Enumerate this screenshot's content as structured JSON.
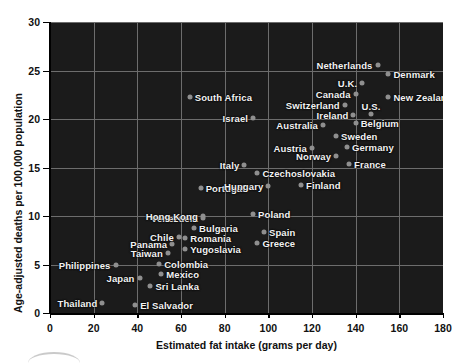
{
  "chart_data": {
    "type": "scatter",
    "title": "",
    "xlabel": "Estimated fat intake (grams per day)",
    "ylabel": "Age-adjusted deaths per 100,000 population",
    "xlim": [
      0,
      180
    ],
    "ylim": [
      0,
      30
    ],
    "xticks": [
      0,
      20,
      40,
      60,
      80,
      100,
      120,
      140,
      160,
      180
    ],
    "yticks": [
      0,
      5,
      10,
      15,
      20,
      25,
      30
    ],
    "grid": true,
    "legend": "none",
    "background": "#1b1b1b",
    "point_color": "#8f8f8f",
    "label_color": "#f2f2f2",
    "points": [
      {
        "name": "Thailand",
        "x": 24,
        "y": 1.0,
        "side": "right"
      },
      {
        "name": "El Salvador",
        "x": 39,
        "y": 0.8,
        "side": "left"
      },
      {
        "name": "Sri Lanka",
        "x": 46,
        "y": 2.8,
        "side": "left"
      },
      {
        "name": "Japan",
        "x": 41,
        "y": 3.6,
        "side": "right"
      },
      {
        "name": "Mexico",
        "x": 51,
        "y": 4.0,
        "side": "left"
      },
      {
        "name": "Philippines",
        "x": 30,
        "y": 5.0,
        "side": "right"
      },
      {
        "name": "Colombia",
        "x": 50,
        "y": 5.1,
        "side": "left"
      },
      {
        "name": "Taiwan",
        "x": 54,
        "y": 6.2,
        "side": "right"
      },
      {
        "name": "Yugoslavia",
        "x": 62,
        "y": 6.6,
        "side": "left"
      },
      {
        "name": "Panama",
        "x": 56,
        "y": 7.1,
        "side": "right"
      },
      {
        "name": "Greece",
        "x": 95,
        "y": 7.2,
        "side": "left"
      },
      {
        "name": "Romania",
        "x": 62,
        "y": 7.7,
        "side": "left"
      },
      {
        "name": "Chile",
        "x": 59,
        "y": 7.8,
        "side": "right"
      },
      {
        "name": "Spain",
        "x": 98,
        "y": 8.4,
        "side": "left"
      },
      {
        "name": "Bulgaria",
        "x": 66,
        "y": 8.8,
        "side": "left"
      },
      {
        "name": "Venezuela",
        "x": 70,
        "y": 9.8,
        "side": "right"
      },
      {
        "name": "Hong Kong",
        "x": 70,
        "y": 10.0,
        "side": "right"
      },
      {
        "name": "Poland",
        "x": 93,
        "y": 10.2,
        "side": "left"
      },
      {
        "name": "Portugal",
        "x": 69,
        "y": 12.9,
        "side": "left"
      },
      {
        "name": "Hungary",
        "x": 100,
        "y": 13.1,
        "side": "right"
      },
      {
        "name": "Finland",
        "x": 115,
        "y": 13.2,
        "side": "left"
      },
      {
        "name": "Czechoslovakia",
        "x": 95,
        "y": 14.4,
        "side": "left"
      },
      {
        "name": "Italy",
        "x": 89,
        "y": 15.3,
        "side": "right"
      },
      {
        "name": "France",
        "x": 137,
        "y": 15.4,
        "side": "left"
      },
      {
        "name": "Norway",
        "x": 131,
        "y": 16.2,
        "side": "right"
      },
      {
        "name": "Austria",
        "x": 120,
        "y": 17.0,
        "side": "right"
      },
      {
        "name": "Germany",
        "x": 136,
        "y": 17.1,
        "side": "left"
      },
      {
        "name": "Sweden",
        "x": 131,
        "y": 18.2,
        "side": "left"
      },
      {
        "name": "Australia",
        "x": 125,
        "y": 19.4,
        "side": "right"
      },
      {
        "name": "Belgium",
        "x": 140,
        "y": 19.6,
        "side": "left"
      },
      {
        "name": "Israel",
        "x": 93,
        "y": 20.1,
        "side": "right"
      },
      {
        "name": "Ireland",
        "x": 139,
        "y": 20.4,
        "side": "right"
      },
      {
        "name": "U.S.",
        "x": 147,
        "y": 20.5,
        "side": "above"
      },
      {
        "name": "Switzerland",
        "x": 135,
        "y": 21.4,
        "side": "right"
      },
      {
        "name": "South Africa",
        "x": 64,
        "y": 22.3,
        "side": "left"
      },
      {
        "name": "New Zealand",
        "x": 155,
        "y": 22.3,
        "side": "left"
      },
      {
        "name": "Canada",
        "x": 140,
        "y": 22.6,
        "side": "right"
      },
      {
        "name": "U.K.",
        "x": 143,
        "y": 23.7,
        "side": "right"
      },
      {
        "name": "Denmark",
        "x": 155,
        "y": 24.6,
        "side": "left"
      },
      {
        "name": "Netherlands",
        "x": 150,
        "y": 25.6,
        "side": "right"
      }
    ]
  },
  "axes": {
    "x_title": "Estimated fat intake (grams per day)",
    "y_title": "Age-adjusted deaths per 100,000 population",
    "x_tick_labels": [
      "0",
      "20",
      "40",
      "60",
      "80",
      "100",
      "120",
      "140",
      "160",
      "180"
    ],
    "y_tick_labels": [
      "0",
      "5",
      "10",
      "15",
      "20",
      "25",
      "30"
    ]
  }
}
